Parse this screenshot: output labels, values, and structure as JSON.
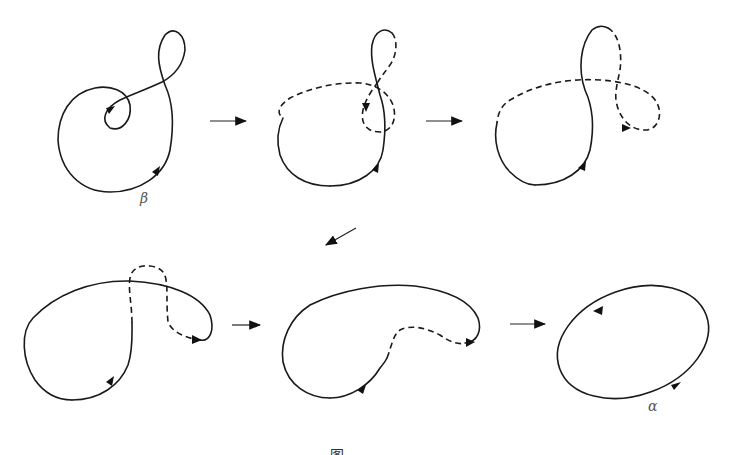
{
  "figure": {
    "panels": [
      {
        "id": 1,
        "row": 1,
        "label": "β",
        "style": "solid figure-eight loop with inner spiral"
      },
      {
        "id": 2,
        "row": 1,
        "label": "",
        "style": "partially dashed"
      },
      {
        "id": 3,
        "row": 1,
        "label": "",
        "style": "partially dashed"
      },
      {
        "id": 4,
        "row": 2,
        "label": "",
        "style": "partially dashed"
      },
      {
        "id": 5,
        "row": 2,
        "label": "",
        "style": "partially dashed"
      },
      {
        "id": 6,
        "row": 2,
        "label": "α",
        "style": "solid simple ellipse"
      }
    ],
    "labels": {
      "beta": "β",
      "alpha": "α"
    },
    "caption": "图"
  }
}
